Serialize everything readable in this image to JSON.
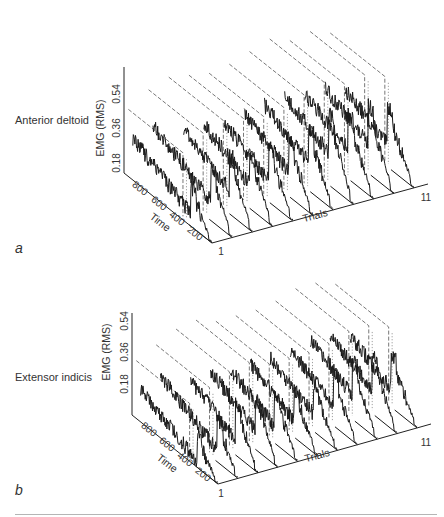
{
  "figure": {
    "panels": [
      {
        "id": "a",
        "letter": "a",
        "muscle": "Anterior deltoid",
        "zlabel": "EMG (RMS)",
        "zticks": [
          "0.18",
          "0.36",
          "0.54"
        ],
        "ylabel": "Time",
        "yticks": [
          "800",
          "600",
          "400",
          "200"
        ],
        "xlabel": "Trials",
        "xticks": [
          "1",
          "11"
        ]
      },
      {
        "id": "b",
        "letter": "b",
        "muscle": "Extensor indicis",
        "zlabel": "EMG (RMS)",
        "zticks": [
          "0.18",
          "0.36",
          "0.54"
        ],
        "ylabel": "Time",
        "yticks": [
          "800",
          "600",
          "400",
          "200"
        ],
        "xlabel": "Trials",
        "xticks": [
          "1",
          "11"
        ]
      }
    ]
  },
  "chart_data": [
    {
      "type": "line",
      "subtype": "3d-waterfall",
      "title": "Anterior deltoid",
      "panel_label": "a",
      "xlabel": "Trials",
      "ylabel": "Time",
      "zlabel": "EMG (RMS)",
      "x_range": [
        1,
        11
      ],
      "y_ticks": [
        800,
        600,
        400,
        200
      ],
      "z_ticks": [
        0.18,
        0.36,
        0.54
      ],
      "series_count": 11,
      "series": [
        {
          "name": "Trial 1",
          "peak_time": 200,
          "baseline_level": 0.16,
          "peak_level": 0.22
        },
        {
          "name": "Trial 2",
          "peak_time": 200,
          "baseline_level": 0.2,
          "peak_level": 0.3
        },
        {
          "name": "Trial 3",
          "peak_time": 220,
          "baseline_level": 0.22,
          "peak_level": 0.34
        },
        {
          "name": "Trial 4",
          "peak_time": 220,
          "baseline_level": 0.22,
          "peak_level": 0.32
        },
        {
          "name": "Trial 5",
          "peak_time": 230,
          "baseline_level": 0.2,
          "peak_level": 0.3
        },
        {
          "name": "Trial 6",
          "peak_time": 230,
          "baseline_level": 0.22,
          "peak_level": 0.32
        },
        {
          "name": "Trial 7",
          "peak_time": 240,
          "baseline_level": 0.24,
          "peak_level": 0.36
        },
        {
          "name": "Trial 8",
          "peak_time": 240,
          "baseline_level": 0.26,
          "peak_level": 0.4
        },
        {
          "name": "Trial 9",
          "peak_time": 250,
          "baseline_level": 0.24,
          "peak_level": 0.36
        },
        {
          "name": "Trial 10",
          "peak_time": 250,
          "baseline_level": 0.24,
          "peak_level": 0.38
        },
        {
          "name": "Trial 11",
          "peak_time": 260,
          "baseline_level": 0.2,
          "peak_level": 0.34
        }
      ],
      "reference_lines": "dashed (mean) and dotted (onset) markers per trial",
      "grid": false,
      "legend": "none"
    },
    {
      "type": "line",
      "subtype": "3d-waterfall",
      "title": "Extensor indicis",
      "panel_label": "b",
      "xlabel": "Trials",
      "ylabel": "Time",
      "zlabel": "EMG (RMS)",
      "x_range": [
        1,
        11
      ],
      "y_ticks": [
        800,
        600,
        400,
        200
      ],
      "z_ticks": [
        0.18,
        0.36,
        0.54
      ],
      "series_count": 11,
      "series": [
        {
          "name": "Trial 1",
          "peak_time": 200,
          "baseline_level": 0.12,
          "peak_level": 0.18
        },
        {
          "name": "Trial 2",
          "peak_time": 200,
          "baseline_level": 0.16,
          "peak_level": 0.24
        },
        {
          "name": "Trial 3",
          "peak_time": 220,
          "baseline_level": 0.18,
          "peak_level": 0.3
        },
        {
          "name": "Trial 4",
          "peak_time": 220,
          "baseline_level": 0.2,
          "peak_level": 0.32
        },
        {
          "name": "Trial 5",
          "peak_time": 230,
          "baseline_level": 0.18,
          "peak_level": 0.28
        },
        {
          "name": "Trial 6",
          "peak_time": 230,
          "baseline_level": 0.18,
          "peak_level": 0.28
        },
        {
          "name": "Trial 7",
          "peak_time": 240,
          "baseline_level": 0.18,
          "peak_level": 0.28
        },
        {
          "name": "Trial 8",
          "peak_time": 240,
          "baseline_level": 0.2,
          "peak_level": 0.3
        },
        {
          "name": "Trial 9",
          "peak_time": 250,
          "baseline_level": 0.22,
          "peak_level": 0.34
        },
        {
          "name": "Trial 10",
          "peak_time": 250,
          "baseline_level": 0.22,
          "peak_level": 0.34
        },
        {
          "name": "Trial 11",
          "peak_time": 260,
          "baseline_level": 0.18,
          "peak_level": 0.3
        }
      ],
      "reference_lines": "dashed (mean) and dotted (onset) markers per trial",
      "grid": false,
      "legend": "none"
    }
  ]
}
